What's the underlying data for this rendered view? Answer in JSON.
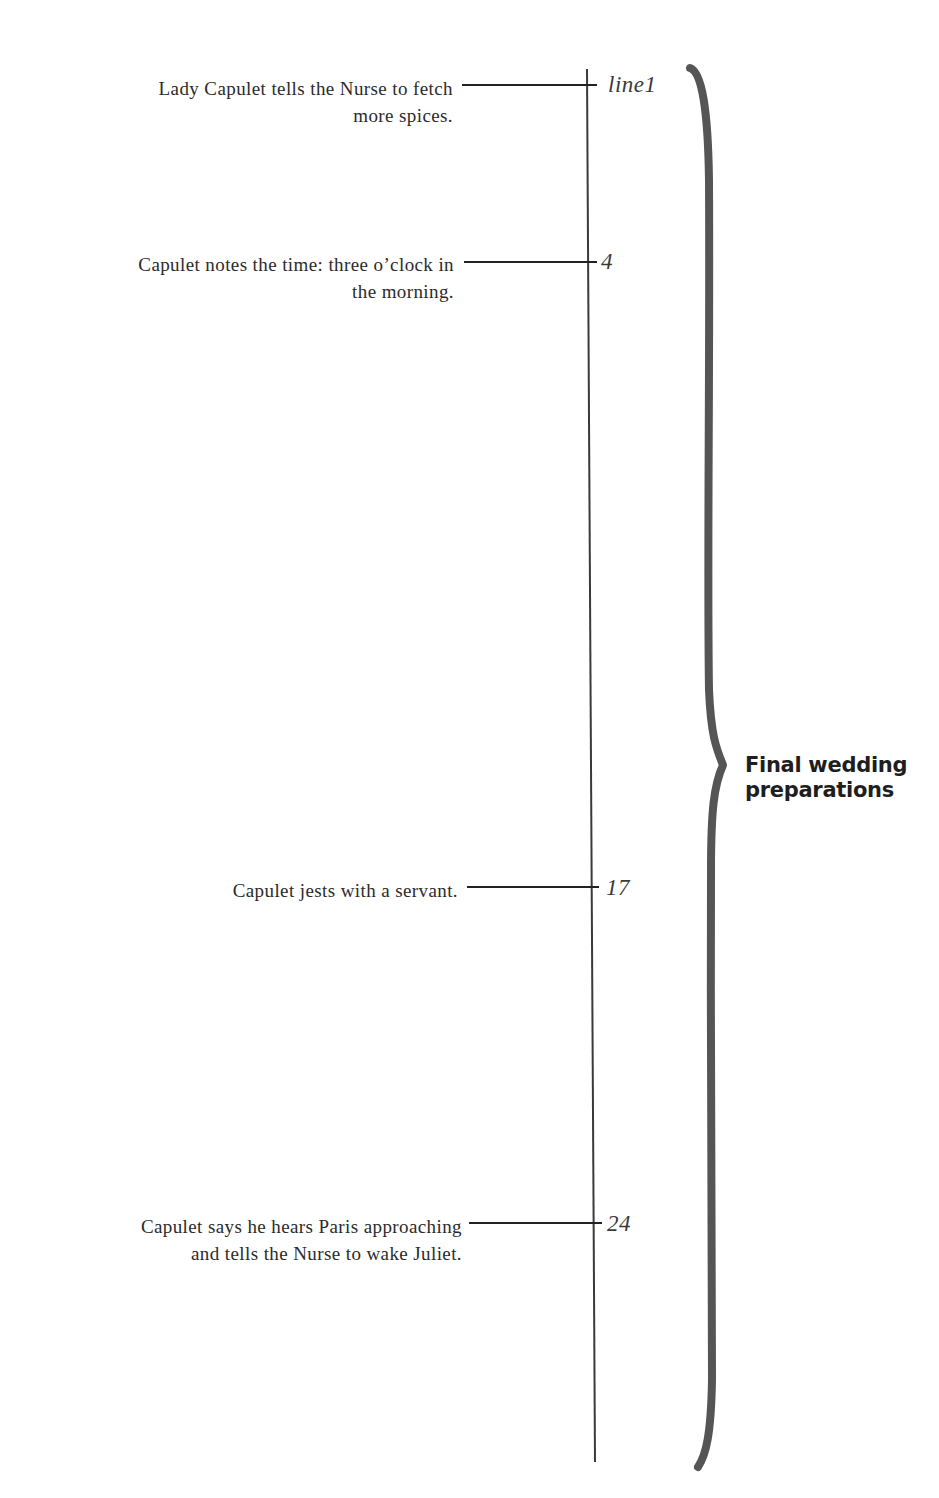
{
  "diagram": {
    "events": [
      {
        "text": "Lady Capulet tells the Nurse to fetch more spices.",
        "line_1": "Lady Capulet tells the Nurse to fetch",
        "line_2": "more spices.",
        "line_number": "line1"
      },
      {
        "text": "Capulet notes the time: three o’clock in the morning.",
        "line_1": "Capulet notes the time: three o’clock in",
        "line_2": "the morning.",
        "line_number": "4"
      },
      {
        "text": "Capulet jests with a servant.",
        "line_1": "Capulet jests with a servant.",
        "line_number": "17"
      },
      {
        "text": "Capulet says he hears Paris approaching and tells the Nurse to wake Juliet.",
        "line_1": "Capulet says he hears Paris approaching",
        "line_2": "and tells the Nurse to wake Juliet.",
        "line_number": "24"
      }
    ],
    "brace": {
      "label_line_1": "Final wedding",
      "label_line_2": "preparations",
      "color": "#555555"
    },
    "colors": {
      "text": "#2b2b2b",
      "timeline": "#333333",
      "brace": "#555555",
      "background": "#ffffff"
    }
  }
}
